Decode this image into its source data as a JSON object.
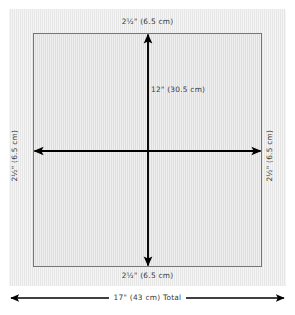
{
  "diagram": {
    "colors": {
      "panel_fill": "#e9e9e9",
      "inner_fill": "#e1e1e1",
      "inner_border": "#757575",
      "arrow": "#000000",
      "text": "#3a3a3a",
      "background": "#ffffff"
    },
    "labels": {
      "top_margin": "2½\" (6.5 cm)",
      "bottom_margin": "2½\" (6.5 cm)",
      "left_margin": "2½\" (6.5 cm)",
      "right_margin": "2½\" (6.5 cm)",
      "center_dimension": "12\" (30.5 cm)",
      "total_width": "17\" (43 cm) Total"
    },
    "measurements": [
      {
        "name": "top-margin",
        "inches": "2½\"",
        "metric": "6.5 cm"
      },
      {
        "name": "bottom-margin",
        "inches": "2½\"",
        "metric": "6.5 cm"
      },
      {
        "name": "left-margin",
        "inches": "2½\"",
        "metric": "6.5 cm"
      },
      {
        "name": "right-margin",
        "inches": "2½\"",
        "metric": "6.5 cm"
      },
      {
        "name": "inner-square",
        "inches": "12\"",
        "metric": "30.5 cm"
      },
      {
        "name": "total-width",
        "inches": "17\"",
        "metric": "43 cm"
      }
    ],
    "arrows": {
      "vertical": "double-headed-arrow",
      "horizontal": "double-headed-arrow",
      "total": "double-headed-arrow"
    }
  }
}
